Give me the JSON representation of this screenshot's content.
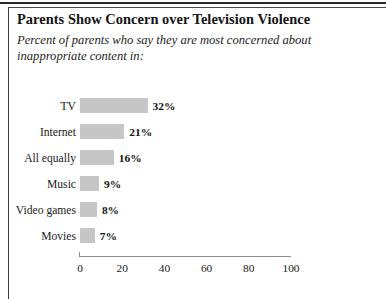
{
  "figure": {
    "title": "Parents Show Concern over Television Violence",
    "subtitle": "Percent of parents who say they are most concerned about inappropriate  content in:"
  },
  "chart_data": {
    "type": "bar",
    "orientation": "horizontal",
    "title": "Parents Show Concern over Television Violence",
    "subtitle": "Percent of parents who say they are most concerned about inappropriate  content in:",
    "categories": [
      "TV",
      "Internet",
      "All equally",
      "Music",
      "Video games",
      "Movies"
    ],
    "values": [
      32,
      21,
      16,
      9,
      8,
      7
    ],
    "value_labels": [
      "32%",
      "21%",
      "16%",
      "9%",
      "8%",
      "7%"
    ],
    "xlabel": "",
    "ylabel": "",
    "xlim": [
      0,
      100
    ],
    "xticks": [
      0,
      20,
      40,
      60,
      80,
      100
    ],
    "xtick_labels": [
      "0",
      "20",
      "40",
      "60",
      "80",
      "100"
    ],
    "grid": false,
    "legend": false,
    "bar_color": "#c6c6c6",
    "axis_color": "#8c8c8c"
  }
}
